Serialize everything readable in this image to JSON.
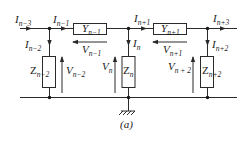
{
  "diagram": {
    "type": "ladder-network-circuit",
    "caption": "(a)",
    "colors": {
      "line": "#2a2a2a",
      "background": "#ffffff",
      "text": "#1a1a1a"
    },
    "currents": [
      {
        "id": "I_n-3",
        "base": "I",
        "sub": "n−3"
      },
      {
        "id": "I_n-1",
        "base": "I",
        "sub": "n−1"
      },
      {
        "id": "I_n-2",
        "base": "I",
        "sub": "n−2"
      },
      {
        "id": "I_n+1",
        "base": "I",
        "sub": "n+1"
      },
      {
        "id": "I_n",
        "base": "I",
        "sub": "n"
      },
      {
        "id": "I_n+3",
        "base": "I",
        "sub": "n+3"
      },
      {
        "id": "I_n+2",
        "base": "I",
        "sub": "n+2"
      }
    ],
    "admittances": [
      {
        "id": "Y_n-1",
        "base": "Y",
        "sub": "n−1"
      },
      {
        "id": "Y_n+1",
        "base": "Y",
        "sub": "n+1"
      }
    ],
    "impedances": [
      {
        "id": "Z_n-2",
        "base": "Z",
        "sub": "n−2"
      },
      {
        "id": "Z_n",
        "base": "Z",
        "sub": "n"
      },
      {
        "id": "Z_n+2",
        "base": "Z",
        "sub": "n+2"
      }
    ],
    "voltages": [
      {
        "id": "V_n-1",
        "base": "V",
        "sub": "n−1"
      },
      {
        "id": "V_n+1",
        "base": "V",
        "sub": "n+1"
      },
      {
        "id": "V_n-2",
        "base": "V",
        "sub": "n−2"
      },
      {
        "id": "V_n",
        "base": "V",
        "sub": "n"
      },
      {
        "id": "V_n+2",
        "base": "V",
        "sub": "n + 2"
      }
    ]
  }
}
